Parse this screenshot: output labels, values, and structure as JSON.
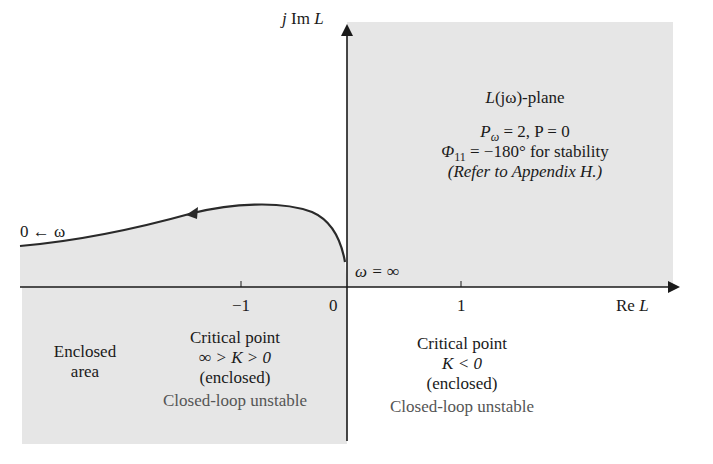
{
  "axes": {
    "imag_label_prefix": "j Im ",
    "imag_label_var": "L",
    "real_label_prefix": "Re ",
    "real_label_var": "L",
    "ticks": [
      {
        "value": -1,
        "label": "−1"
      },
      {
        "value": 0,
        "label": "0"
      },
      {
        "value": 1,
        "label": "1"
      }
    ]
  },
  "plane_info": {
    "plane_label_L": "L",
    "plane_label_rest": "(jω)-plane",
    "line1": "Pω = 2, P = 0",
    "line1_P": "P",
    "line1_sub": "ω",
    "line1_rest": " = 2, P = 0",
    "line2_phi": "Φ",
    "line2_sub": "11",
    "line2_rest": " = −180° for stability",
    "line3": "(Refer to Appendix H.)"
  },
  "curve_labels": {
    "start": "0 ← ω",
    "end": "ω = ∞"
  },
  "regions": {
    "enclosed_area": [
      "Enclosed",
      "area"
    ],
    "left_critical": {
      "title": "Critical point",
      "condition": "∞ > K > 0",
      "status": "(enclosed)",
      "stability": "Closed-loop unstable"
    },
    "right_critical": {
      "title": "Critical point",
      "condition": "K < 0",
      "status": "(enclosed)",
      "stability": "Closed-loop unstable"
    }
  },
  "colors": {
    "shade": "#e6e6e6",
    "ink": "#1a1a1a",
    "note_gray": "#555555"
  }
}
